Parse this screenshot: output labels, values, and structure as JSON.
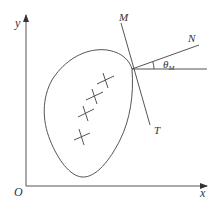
{
  "diagram": {
    "axes": {
      "x_label": "x",
      "y_label": "y",
      "origin_label": "O"
    },
    "lines": {
      "M_label": "M",
      "N_label": "N",
      "T_label": "T"
    },
    "angle": {
      "symbol": "θ",
      "subscript": "M"
    },
    "markers": {
      "count": 4,
      "symbol": "cross"
    },
    "colors": {
      "stroke": "#555555",
      "text": "#333333",
      "background": "#ffffff"
    }
  }
}
